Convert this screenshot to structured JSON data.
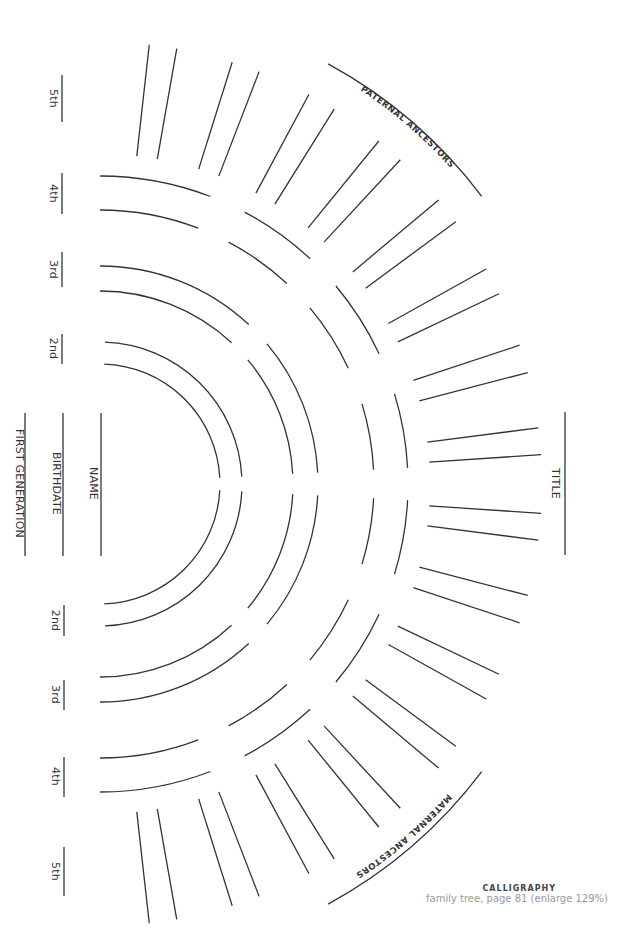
{
  "colors": {
    "line": "#333333",
    "background": "#ffffff",
    "caption_title": "#444444",
    "caption_sub": "#999999"
  },
  "chart_data": {
    "type": "fan-chart-template",
    "center": [
      100,
      484
    ],
    "generations": [
      "FIRST GENERATION",
      "2nd",
      "3rd",
      "4th",
      "5th"
    ],
    "rings": {
      "gen2": {
        "radii": [
          120,
          142
        ],
        "segments_deg": [
          [
            2,
            87
          ]
        ]
      },
      "gen3": {
        "radii": [
          193,
          218
        ],
        "segments_deg": [
          [
            0,
            43
          ],
          [
            50,
            87
          ]
        ]
      },
      "gen4": {
        "radii": [
          274,
          308
        ],
        "segments_deg": [
          [
            0,
            21
          ],
          [
            28,
            43
          ],
          [
            50,
            65
          ],
          [
            73,
            87
          ]
        ]
      },
      "gen5_spokes": {
        "r_inner": 330,
        "r_outer": 442,
        "angles_deg": [
          6.4,
          10,
          17.4,
          21.1,
          28.2,
          32,
          39.1,
          42.8,
          50,
          53.6,
          60.9,
          64.5,
          71.7,
          75.4,
          82.7,
          86.2
        ]
      }
    },
    "outer_label_arcs": {
      "radius": 478,
      "from_deg": 28.5,
      "to_deg": 53
    }
  },
  "labels": {
    "first_generation": "FIRST GENERATION",
    "birthdate": "BIRTHDATE",
    "name": "NAME",
    "title": "TITLE",
    "paternal": "PATERNAL ANCESTORS",
    "maternal": "MATERNAL ANCESTORS"
  },
  "generation_markers": {
    "top": [
      {
        "label": "5th",
        "y1": 75,
        "y2": 122
      },
      {
        "label": "4th",
        "y1": 173,
        "y2": 214
      },
      {
        "label": "3rd",
        "y1": 252,
        "y2": 287
      },
      {
        "label": "2nd",
        "y1": 334,
        "y2": 364
      }
    ],
    "bottom": [
      {
        "label": "2nd",
        "y1": 605,
        "y2": 636
      },
      {
        "label": "3rd",
        "y1": 680,
        "y2": 710
      },
      {
        "label": "4th",
        "y1": 757,
        "y2": 797
      },
      {
        "label": "5th",
        "y1": 847,
        "y2": 896
      }
    ]
  },
  "caption": {
    "title": "CALLIGRAPHY",
    "subtitle": "family tree, page 81 (enlarge 129%)"
  }
}
